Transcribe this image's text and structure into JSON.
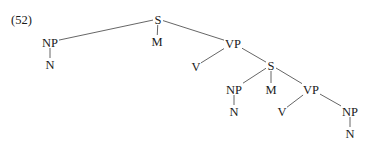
{
  "example_number": "(52)",
  "tree": {
    "nodes": [
      {
        "id": "s1",
        "label": "S",
        "x": 158,
        "y": 19
      },
      {
        "id": "np1",
        "label": "NP",
        "x": 50,
        "y": 42
      },
      {
        "id": "n1",
        "label": "N",
        "x": 50,
        "y": 64
      },
      {
        "id": "m1",
        "label": "M",
        "x": 157,
        "y": 41
      },
      {
        "id": "vp1",
        "label": "VP",
        "x": 233,
        "y": 43
      },
      {
        "id": "v1",
        "label": "V",
        "x": 196,
        "y": 66
      },
      {
        "id": "s2",
        "label": "S",
        "x": 271,
        "y": 65
      },
      {
        "id": "np2",
        "label": "NP",
        "x": 234,
        "y": 89
      },
      {
        "id": "n2",
        "label": "N",
        "x": 234,
        "y": 111
      },
      {
        "id": "m2",
        "label": "M",
        "x": 271,
        "y": 89
      },
      {
        "id": "vp2",
        "label": "VP",
        "x": 311,
        "y": 89
      },
      {
        "id": "v2",
        "label": "V",
        "x": 282,
        "y": 111
      },
      {
        "id": "np3",
        "label": "NP",
        "x": 350,
        "y": 111
      },
      {
        "id": "n3",
        "label": "N",
        "x": 350,
        "y": 133
      }
    ],
    "edges": [
      [
        "s1",
        "np1"
      ],
      [
        "s1",
        "m1"
      ],
      [
        "s1",
        "vp1"
      ],
      [
        "np1",
        "n1"
      ],
      [
        "vp1",
        "v1"
      ],
      [
        "vp1",
        "s2"
      ],
      [
        "s2",
        "np2"
      ],
      [
        "s2",
        "m2"
      ],
      [
        "s2",
        "vp2"
      ],
      [
        "np2",
        "n2"
      ],
      [
        "vp2",
        "v2"
      ],
      [
        "vp2",
        "np3"
      ],
      [
        "np3",
        "n3"
      ]
    ]
  }
}
